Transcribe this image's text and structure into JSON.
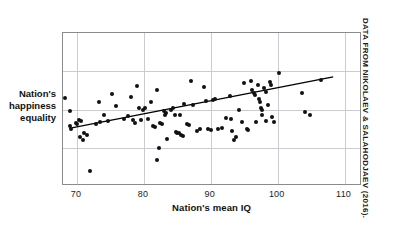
{
  "figure": {
    "credit": "DATA FROM NIKOLAEV & SALAHODJAEV (2016)."
  },
  "axis": {
    "xlabel": "Nation's mean IQ",
    "ylabel_line1": "Nation's",
    "ylabel_line2": "happiness",
    "ylabel_line3": "equality",
    "xticks": [
      "70",
      "80",
      "90",
      "100",
      "110"
    ]
  },
  "colors": {
    "point": "#111111",
    "trendline": "#000000",
    "gridline": "#c9ccd0",
    "frame": "#888c8f",
    "background": "#ffffff"
  },
  "chart_data": {
    "type": "scatter",
    "title": "",
    "xlabel": "Nation's mean IQ",
    "ylabel": "Nation's happiness equality",
    "xlim": [
      67.9,
      112.6
    ],
    "ylim": [
      0,
      1
    ],
    "xticks": [
      70,
      80,
      90,
      100,
      110
    ],
    "yticks": [],
    "grid": true,
    "legend": null,
    "annotations": [
      "DATA FROM NIKOLAEV & SALAHODJAEV (2016)."
    ],
    "trendline": {
      "type": "linear",
      "x_start": 69.2,
      "y_start": 0.38,
      "x_end": 108.3,
      "y_end": 0.713
    },
    "points": [
      {
        "x": 68.2,
        "y": 0.575
      },
      {
        "x": 69.0,
        "y": 0.49
      },
      {
        "x": 68.9,
        "y": 0.392
      },
      {
        "x": 69.1,
        "y": 0.372
      },
      {
        "x": 69.8,
        "y": 0.412
      },
      {
        "x": 70.0,
        "y": 0.405
      },
      {
        "x": 70.3,
        "y": 0.432
      },
      {
        "x": 70.6,
        "y": 0.425
      },
      {
        "x": 70.5,
        "y": 0.32
      },
      {
        "x": 70.9,
        "y": 0.3
      },
      {
        "x": 71.1,
        "y": 0.345
      },
      {
        "x": 71.5,
        "y": 0.332
      },
      {
        "x": 72.0,
        "y": 0.098
      },
      {
        "x": 72.8,
        "y": 0.405
      },
      {
        "x": 73.2,
        "y": 0.547
      },
      {
        "x": 73.4,
        "y": 0.418
      },
      {
        "x": 74.0,
        "y": 0.465
      },
      {
        "x": 74.6,
        "y": 0.425
      },
      {
        "x": 75.2,
        "y": 0.6
      },
      {
        "x": 75.8,
        "y": 0.525
      },
      {
        "x": 77.0,
        "y": 0.44
      },
      {
        "x": 77.6,
        "y": 0.455
      },
      {
        "x": 78.0,
        "y": 0.582
      },
      {
        "x": 78.3,
        "y": 0.43
      },
      {
        "x": 78.6,
        "y": 0.412
      },
      {
        "x": 79.0,
        "y": 0.652
      },
      {
        "x": 79.2,
        "y": 0.512
      },
      {
        "x": 79.5,
        "y": 0.43
      },
      {
        "x": 79.9,
        "y": 0.5
      },
      {
        "x": 80.2,
        "y": 0.512
      },
      {
        "x": 80.6,
        "y": 0.438
      },
      {
        "x": 81.0,
        "y": 0.548
      },
      {
        "x": 81.3,
        "y": 0.392
      },
      {
        "x": 81.6,
        "y": 0.388
      },
      {
        "x": 81.9,
        "y": 0.625
      },
      {
        "x": 82.0,
        "y": 0.168
      },
      {
        "x": 82.2,
        "y": 0.248
      },
      {
        "x": 82.4,
        "y": 0.41
      },
      {
        "x": 82.7,
        "y": 0.405
      },
      {
        "x": 83.0,
        "y": 0.492
      },
      {
        "x": 83.2,
        "y": 0.465
      },
      {
        "x": 83.3,
        "y": 0.478
      },
      {
        "x": 83.5,
        "y": 0.305
      },
      {
        "x": 84.0,
        "y": 0.5
      },
      {
        "x": 84.3,
        "y": 0.512
      },
      {
        "x": 84.6,
        "y": 0.462
      },
      {
        "x": 84.8,
        "y": 0.352
      },
      {
        "x": 85.0,
        "y": 0.345
      },
      {
        "x": 85.2,
        "y": 0.348
      },
      {
        "x": 85.4,
        "y": 0.462
      },
      {
        "x": 85.6,
        "y": 0.332
      },
      {
        "x": 85.9,
        "y": 0.33
      },
      {
        "x": 86.0,
        "y": 0.538
      },
      {
        "x": 86.4,
        "y": 0.408
      },
      {
        "x": 86.7,
        "y": 0.402
      },
      {
        "x": 87.0,
        "y": 0.688
      },
      {
        "x": 87.3,
        "y": 0.532
      },
      {
        "x": 88.0,
        "y": 0.358
      },
      {
        "x": 88.4,
        "y": 0.37
      },
      {
        "x": 89.0,
        "y": 0.645
      },
      {
        "x": 89.2,
        "y": 0.555
      },
      {
        "x": 89.6,
        "y": 0.372
      },
      {
        "x": 90.0,
        "y": 0.368
      },
      {
        "x": 90.3,
        "y": 0.562
      },
      {
        "x": 90.6,
        "y": 0.568
      },
      {
        "x": 91.0,
        "y": 0.372
      },
      {
        "x": 91.6,
        "y": 0.378
      },
      {
        "x": 92.3,
        "y": 0.442
      },
      {
        "x": 92.8,
        "y": 0.588
      },
      {
        "x": 93.0,
        "y": 0.44
      },
      {
        "x": 93.2,
        "y": 0.36
      },
      {
        "x": 93.5,
        "y": 0.302
      },
      {
        "x": 93.8,
        "y": 0.318
      },
      {
        "x": 94.2,
        "y": 0.498
      },
      {
        "x": 94.6,
        "y": 0.42
      },
      {
        "x": 95.0,
        "y": 0.672
      },
      {
        "x": 95.4,
        "y": 0.372
      },
      {
        "x": 95.6,
        "y": 0.368
      },
      {
        "x": 96.0,
        "y": 0.685
      },
      {
        "x": 96.2,
        "y": 0.625
      },
      {
        "x": 96.4,
        "y": 0.605
      },
      {
        "x": 96.6,
        "y": 0.598
      },
      {
        "x": 96.8,
        "y": 0.418
      },
      {
        "x": 97.0,
        "y": 0.658
      },
      {
        "x": 97.2,
        "y": 0.57
      },
      {
        "x": 97.3,
        "y": 0.552
      },
      {
        "x": 97.5,
        "y": 0.512
      },
      {
        "x": 97.6,
        "y": 0.498
      },
      {
        "x": 97.7,
        "y": 0.462
      },
      {
        "x": 97.9,
        "y": 0.64
      },
      {
        "x": 98.2,
        "y": 0.612
      },
      {
        "x": 98.3,
        "y": 0.428
      },
      {
        "x": 98.6,
        "y": 0.53
      },
      {
        "x": 98.8,
        "y": 0.682
      },
      {
        "x": 99.0,
        "y": 0.658
      },
      {
        "x": 99.2,
        "y": 0.45
      },
      {
        "x": 99.4,
        "y": 0.418
      },
      {
        "x": 100.2,
        "y": 0.742
      },
      {
        "x": 103.6,
        "y": 0.608
      },
      {
        "x": 104.0,
        "y": 0.482
      },
      {
        "x": 104.8,
        "y": 0.462
      },
      {
        "x": 106.4,
        "y": 0.69
      }
    ]
  }
}
